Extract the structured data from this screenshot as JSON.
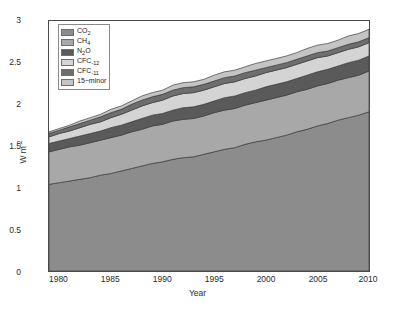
{
  "chart_data": {
    "type": "area",
    "stacked": true,
    "title": "",
    "xlabel": "Year",
    "ylabel": "W m-2",
    "ylabel_unit_exponent": "-2",
    "xlim": [
      1979,
      2010
    ],
    "ylim": [
      0,
      3
    ],
    "xticks": [
      1980,
      1985,
      1990,
      1995,
      2000,
      2005,
      2010
    ],
    "yticks": [
      0,
      0.5,
      1,
      1.5,
      2,
      2.5,
      3
    ],
    "grid": false,
    "legend_position": "top-left",
    "x": [
      1979,
      1980,
      1981,
      1982,
      1983,
      1984,
      1985,
      1986,
      1987,
      1988,
      1989,
      1990,
      1991,
      1992,
      1993,
      1994,
      1995,
      1996,
      1997,
      1998,
      1999,
      2000,
      2001,
      2002,
      2003,
      2004,
      2005,
      2006,
      2007,
      2008,
      2009,
      2010
    ],
    "series": [
      {
        "name": "CO2",
        "label": "CO₂",
        "color": "#8c8c8c",
        "values": [
          1.04,
          1.06,
          1.08,
          1.1,
          1.12,
          1.15,
          1.17,
          1.2,
          1.23,
          1.26,
          1.29,
          1.31,
          1.34,
          1.36,
          1.37,
          1.4,
          1.43,
          1.46,
          1.48,
          1.52,
          1.55,
          1.57,
          1.6,
          1.63,
          1.67,
          1.7,
          1.74,
          1.77,
          1.81,
          1.84,
          1.87,
          1.91
        ]
      },
      {
        "name": "CH4",
        "label": "CH₄",
        "color": "#a8a8a8",
        "values": [
          0.39,
          0.4,
          0.41,
          0.41,
          0.42,
          0.42,
          0.43,
          0.43,
          0.44,
          0.44,
          0.45,
          0.45,
          0.46,
          0.46,
          0.46,
          0.46,
          0.47,
          0.47,
          0.47,
          0.47,
          0.47,
          0.48,
          0.48,
          0.48,
          0.48,
          0.48,
          0.48,
          0.48,
          0.48,
          0.48,
          0.48,
          0.49
        ]
      },
      {
        "name": "N2O",
        "label": "N₂O",
        "color": "#5a5a5a",
        "values": [
          0.1,
          0.1,
          0.1,
          0.11,
          0.11,
          0.11,
          0.12,
          0.12,
          0.12,
          0.13,
          0.13,
          0.13,
          0.13,
          0.14,
          0.14,
          0.14,
          0.14,
          0.15,
          0.15,
          0.15,
          0.15,
          0.16,
          0.16,
          0.16,
          0.16,
          0.17,
          0.17,
          0.17,
          0.17,
          0.18,
          0.18,
          0.18
        ]
      },
      {
        "name": "CFC-12",
        "label": "CFC₋₁₂",
        "color": "#d4d4d4",
        "values": [
          0.08,
          0.09,
          0.09,
          0.1,
          0.11,
          0.11,
          0.12,
          0.13,
          0.14,
          0.15,
          0.15,
          0.16,
          0.17,
          0.17,
          0.17,
          0.17,
          0.17,
          0.17,
          0.17,
          0.17,
          0.17,
          0.17,
          0.17,
          0.17,
          0.17,
          0.17,
          0.17,
          0.16,
          0.16,
          0.16,
          0.16,
          0.16
        ]
      },
      {
        "name": "CFC-11",
        "label": "CFC₋₁₁",
        "color": "#6e6e6e",
        "values": [
          0.04,
          0.04,
          0.05,
          0.05,
          0.05,
          0.06,
          0.06,
          0.06,
          0.07,
          0.07,
          0.07,
          0.07,
          0.07,
          0.07,
          0.07,
          0.07,
          0.07,
          0.07,
          0.07,
          0.07,
          0.07,
          0.06,
          0.06,
          0.06,
          0.06,
          0.06,
          0.06,
          0.06,
          0.06,
          0.06,
          0.06,
          0.06
        ]
      },
      {
        "name": "15-minor",
        "label": "15−minor",
        "color": "#c4c4c4",
        "values": [
          0.02,
          0.02,
          0.02,
          0.03,
          0.03,
          0.03,
          0.04,
          0.04,
          0.04,
          0.05,
          0.05,
          0.05,
          0.06,
          0.06,
          0.06,
          0.06,
          0.07,
          0.07,
          0.07,
          0.07,
          0.08,
          0.08,
          0.08,
          0.08,
          0.08,
          0.09,
          0.09,
          0.09,
          0.09,
          0.1,
          0.1,
          0.1
        ]
      }
    ],
    "totals": [
      1.67,
      1.71,
      1.75,
      1.8,
      1.84,
      1.88,
      1.94,
      1.98,
      2.04,
      2.1,
      2.14,
      2.17,
      2.23,
      2.26,
      2.27,
      2.3,
      2.35,
      2.39,
      2.41,
      2.45,
      2.49,
      2.52,
      2.55,
      2.58,
      2.62,
      2.67,
      2.71,
      2.73,
      2.77,
      2.82,
      2.85,
      2.9
    ]
  },
  "axes": {
    "ylabel_prefix": "W m",
    "ylabel_sup": "-2",
    "xlabel": "Year",
    "ytick_labels": [
      "0",
      "0.5",
      "1",
      "1.5",
      "2",
      "2.5",
      "3"
    ],
    "xtick_labels": [
      "1980",
      "1985",
      "1990",
      "1995",
      "2000",
      "2005",
      "2010"
    ]
  },
  "legend": {
    "entries": [
      {
        "label_main": "CO",
        "label_sub": "2",
        "color": "#8c8c8c"
      },
      {
        "label_main": "CH",
        "label_sub": "4",
        "color": "#a8a8a8"
      },
      {
        "label_main": "N",
        "label_sub": "2",
        "label_tail": "O",
        "color": "#5a5a5a"
      },
      {
        "label_main": "CFC",
        "label_sub": "-12",
        "color": "#d4d4d4"
      },
      {
        "label_main": "CFC",
        "label_sub": "-11",
        "color": "#6e6e6e"
      },
      {
        "label_main": "15−minor",
        "label_sub": "",
        "color": "#c4c4c4"
      }
    ]
  },
  "style": {
    "axis_color": "#4a4a4a",
    "text_color": "#2b2b2b",
    "background": "#ffffff",
    "edge_color": "#3a3a3a"
  }
}
